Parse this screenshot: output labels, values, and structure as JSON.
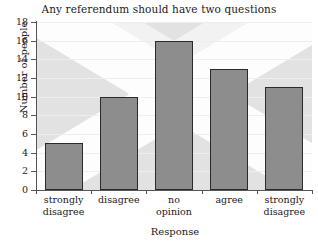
{
  "chart_data": {
    "type": "bar",
    "title": "Any referendum should have two questions",
    "xlabel": "Response",
    "ylabel": "Number of people",
    "categories": [
      "strongly disagree",
      "disagree",
      "no opinion",
      "agree",
      "strongly disagree"
    ],
    "category_lines": [
      [
        "strongly",
        "disagree"
      ],
      [
        "disagree",
        ""
      ],
      [
        "no",
        "opinion"
      ],
      [
        "agree",
        ""
      ],
      [
        "strongly",
        "disagree"
      ]
    ],
    "values": [
      5,
      10,
      16,
      13,
      11
    ],
    "ylim": [
      0,
      18
    ],
    "yticks": [
      0,
      2,
      4,
      6,
      8,
      10,
      12,
      14,
      16,
      18
    ],
    "grid": true,
    "legend": "none",
    "colors": {
      "bar_fill": "#8d8d8d",
      "bar_edge": "#2a2a2a",
      "plot_background": "#e2e2e2",
      "watermark_band": "#fdfdfd",
      "gridline": "#eeeeee",
      "axis": "#555555",
      "text": "#1a1a1a"
    }
  }
}
